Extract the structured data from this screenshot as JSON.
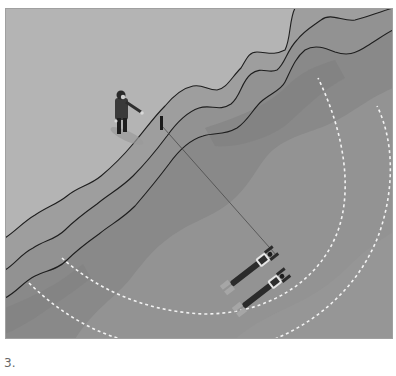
{
  "figure": {
    "caption": "3.",
    "colors": {
      "shore": "#b4b4b4",
      "depth_band_1": "#9c9c9c",
      "depth_band_2": "#8e8e8e",
      "depth_band_3": "#878787",
      "deep_water": "#8f8f8f",
      "contour_line": "#1e1e1e",
      "search_arc": "#f2f2f2",
      "border": "#a0a0a0"
    },
    "elements": {
      "tender": "person-standing-on-shore",
      "stake": "shore-anchor-stake",
      "line": "search-line",
      "divers": [
        "diver-1",
        "diver-2"
      ],
      "arcs": [
        "inner-search-arc",
        "outer-search-arc"
      ]
    }
  }
}
